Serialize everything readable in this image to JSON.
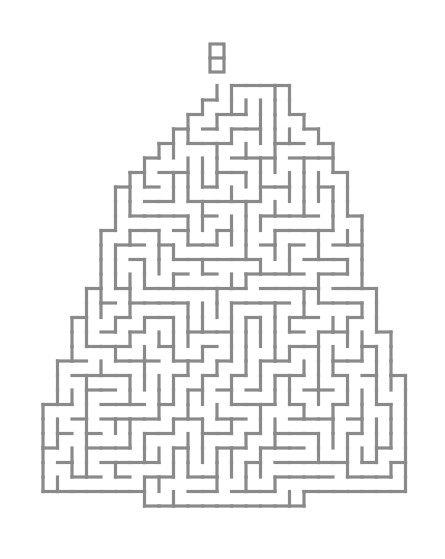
{
  "puzzle": {
    "type": "maze",
    "shape": "christmas-tree",
    "wall_color": "#8a8a8a",
    "background": "#ffffff",
    "cell_size": 14.5,
    "origin": {
      "x": 43,
      "y": 42
    },
    "start_marker": {
      "x": 210,
      "y": 44,
      "w": 14,
      "h": 28
    },
    "rows": [
      {
        "row": 3,
        "from": 12,
        "to": 16
      },
      {
        "row": 4,
        "from": 11,
        "to": 16
      },
      {
        "row": 5,
        "from": 10,
        "to": 17
      },
      {
        "row": 6,
        "from": 9,
        "to": 18
      },
      {
        "row": 7,
        "from": 8,
        "to": 19
      },
      {
        "row": 8,
        "from": 7,
        "to": 19
      },
      {
        "row": 9,
        "from": 6,
        "to": 20
      },
      {
        "row": 10,
        "from": 5,
        "to": 20
      },
      {
        "row": 11,
        "from": 5,
        "to": 20
      },
      {
        "row": 12,
        "from": 5,
        "to": 21
      },
      {
        "row": 13,
        "from": 4,
        "to": 21
      },
      {
        "row": 14,
        "from": 4,
        "to": 21
      },
      {
        "row": 15,
        "from": 4,
        "to": 21
      },
      {
        "row": 16,
        "from": 4,
        "to": 21
      },
      {
        "row": 17,
        "from": 3,
        "to": 22
      },
      {
        "row": 18,
        "from": 3,
        "to": 22
      },
      {
        "row": 19,
        "from": 2,
        "to": 22
      },
      {
        "row": 20,
        "from": 2,
        "to": 23
      },
      {
        "row": 21,
        "from": 2,
        "to": 23
      },
      {
        "row": 22,
        "from": 1,
        "to": 23
      },
      {
        "row": 23,
        "from": 1,
        "to": 24
      },
      {
        "row": 24,
        "from": 1,
        "to": 24
      },
      {
        "row": 25,
        "from": 0,
        "to": 24
      },
      {
        "row": 26,
        "from": 0,
        "to": 24
      },
      {
        "row": 27,
        "from": 0,
        "to": 24
      },
      {
        "row": 28,
        "from": 0,
        "to": 24
      },
      {
        "row": 29,
        "from": 0,
        "to": 24
      },
      {
        "row": 30,
        "from": 0,
        "to": 24
      },
      {
        "row": 31,
        "from": 7,
        "to": 17
      }
    ],
    "seed": 1225
  }
}
